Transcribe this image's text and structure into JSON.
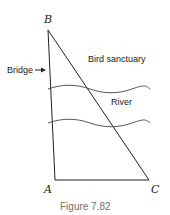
{
  "diagram": {
    "vertices": {
      "A": {
        "label": "A"
      },
      "B": {
        "label": "B"
      },
      "C": {
        "label": "C"
      }
    },
    "labels": {
      "bridge": "Bridge",
      "sanctuary": "Bird sanctuary",
      "river": "River"
    },
    "caption": "Figure 7.82",
    "colors": {
      "line": "#222222",
      "caption": "#7a6a6a"
    }
  }
}
